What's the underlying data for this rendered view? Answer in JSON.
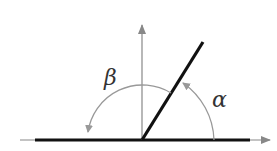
{
  "diagram": {
    "type": "angle-diagram",
    "labels": {
      "alpha": "α",
      "beta": "β"
    },
    "colors": {
      "ray": "#111111",
      "axis": "#888888",
      "arc": "#999999",
      "label": "#333333",
      "background": "#ffffff"
    },
    "elements": [
      {
        "name": "horizontal-axis",
        "description": "horizontal line with arrow pointing right"
      },
      {
        "name": "vertical-axis",
        "description": "vertical line with arrow pointing up"
      },
      {
        "name": "terminal-ray",
        "description": "thick ray at about 58° from positive x-axis"
      },
      {
        "name": "alpha-arc",
        "description": "arc from positive x-axis counterclockwise to ray, labeled α"
      },
      {
        "name": "beta-arc",
        "description": "arc from ray counterclockwise to negative x-axis, labeled β"
      }
    ]
  }
}
